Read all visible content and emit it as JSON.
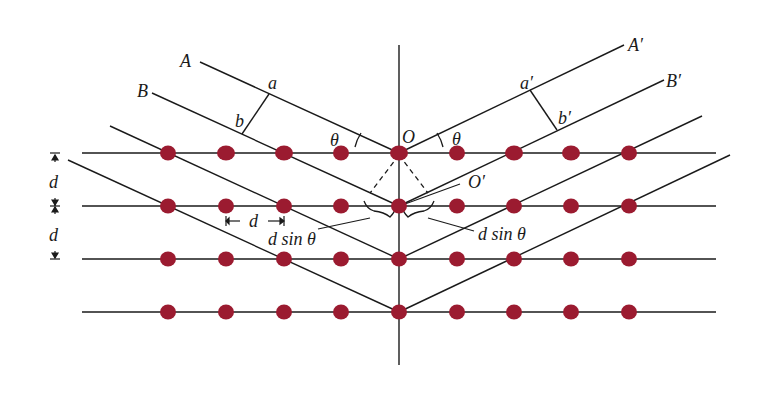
{
  "diagram": {
    "colors": {
      "line": "#1a1a1a",
      "atom": "#9b1b30",
      "background": "#ffffff"
    },
    "lattice": {
      "rows_y": [
        153,
        206,
        259,
        312
      ],
      "atoms_x": [
        168,
        226,
        284,
        341,
        399,
        457,
        514,
        571,
        629
      ],
      "row_line_x": [
        82,
        716
      ]
    },
    "normal_line": {
      "x": 399,
      "y1": 45,
      "y2": 365
    },
    "labels": {
      "A": "A",
      "B": "B",
      "A_prime": "A′",
      "B_prime": "B′",
      "a": "a",
      "b": "b",
      "a_prime": "a′",
      "b_prime": "b′",
      "O": "O",
      "O_prime": "O′",
      "theta_left": "θ",
      "theta_right": "θ",
      "d_vertical_1": "d",
      "d_vertical_2": "d",
      "d_horizontal": "d",
      "dsin_left": "d sin θ",
      "dsin_right": "d sin θ"
    }
  }
}
